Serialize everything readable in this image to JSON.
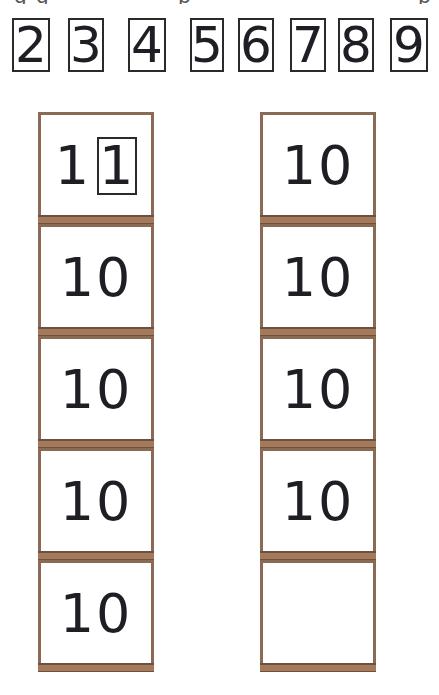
{
  "top_cut_text": {
    "glyphs": [
      {
        "x": 14,
        "char": "g"
      },
      {
        "x": 36,
        "char": "g"
      },
      {
        "x": 178,
        "char": "p"
      },
      {
        "x": 418,
        "char": "p"
      }
    ]
  },
  "digit_row": {
    "digits": [
      {
        "label": "2",
        "x": 12,
        "w": 38
      },
      {
        "label": "3",
        "x": 68,
        "w": 36
      },
      {
        "label": "4",
        "x": 128,
        "w": 38
      },
      {
        "label": "5",
        "x": 190,
        "w": 34
      },
      {
        "label": "6",
        "x": 238,
        "w": 36
      },
      {
        "label": "7",
        "x": 290,
        "w": 36
      },
      {
        "label": "8",
        "x": 338,
        "w": 36
      },
      {
        "label": "9",
        "x": 390,
        "w": 38
      }
    ]
  },
  "left_column": {
    "boxes": [
      {
        "value": "1",
        "boxed_suffix": "1"
      },
      {
        "value": "10"
      },
      {
        "value": "10"
      },
      {
        "value": "10"
      },
      {
        "value": "10"
      }
    ]
  },
  "right_column": {
    "boxes": [
      {
        "value": "10"
      },
      {
        "value": "10"
      },
      {
        "value": "10"
      },
      {
        "value": "10"
      },
      {
        "value": ""
      }
    ]
  },
  "colors": {
    "frame": "#8a6a55",
    "band": "#a47a5a",
    "ink": "#1e1e24"
  }
}
